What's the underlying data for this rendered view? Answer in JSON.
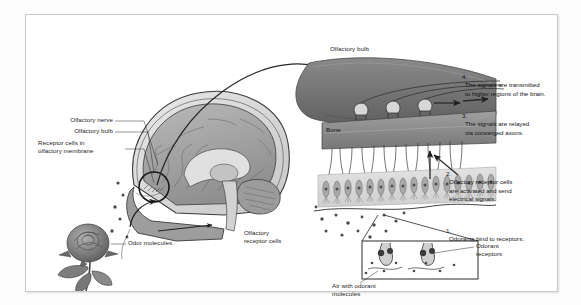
{
  "figure": {
    "background_color": "#ffffff",
    "frame_color": "#c9c9c9"
  },
  "labels": {
    "olfactory_nerve": "Olfactory nerve",
    "olfactory_bulb_head": "Olfactory bulb",
    "receptor_cells_membrane": "Receptor cells in\nolfactory membrane",
    "odor_molecules": "Odor molecules",
    "olfactory_receptor_cells": "Olfactory\nreceptor cells",
    "olfactory_bulb_detail": "Olfactory bulb",
    "bone": "Bone",
    "odorant_receptors": "Odorant\nreceptors",
    "air_with_odorant_molecules": "Air with odorant\nmolecules"
  },
  "steps": [
    {
      "number": "1.",
      "text": "Odorants bind to receptors."
    },
    {
      "number": "2.",
      "text": "Olfactory receptor cells\nare activated and send\nelectrical signals."
    },
    {
      "number": "3.",
      "text": "The signals are relayed\nvia converged axons."
    },
    {
      "number": "4.",
      "text": "The signals are transmitted\nto higher regions of the brain."
    }
  ],
  "icons": {
    "curved_arrow": "curved-arrow-icon",
    "axon_arrow": "right-arrow-icon",
    "signal_arrow": "up-arrow-icon",
    "pointer_arrow": "pointer-arrow-icon",
    "rose": "rose-illustration",
    "brain": "brain-sagittal-illustration",
    "bulb": "olfactory-bulb-illustration"
  },
  "colors": {
    "bulb_fill": "#6f6f6f",
    "bone_fill": "#8e8e8e",
    "epithelium_fill": "#d9d9d9",
    "mucus_fill": "#efefef",
    "line": "#2a2a2a"
  }
}
